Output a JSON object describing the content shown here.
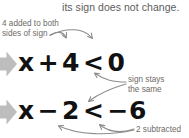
{
  "figure": {
    "header_text": "its sign does not change.",
    "colors": {
      "background": "#ffffff",
      "header_text": "#5d5d5d",
      "annotation_text": "#6e6a66",
      "equation_text": "#111111",
      "bullet_gray": "#bdbdbd",
      "arrow_gray": "#8c8c8c"
    }
  },
  "annotations": {
    "added_to_both_sides": "4 added to both\nsides of sign",
    "sign_stays_the_same": "sign stays\nthe same",
    "two_subtracted": "2 subtracted"
  },
  "equations": [
    {
      "id": "equation-1",
      "full": "x + 4 < 0",
      "left_variable": "x",
      "operator": "+",
      "operand": "4",
      "relation": "<",
      "right_side": "0"
    },
    {
      "id": "equation-2",
      "full": "x − 2 < −6",
      "left_variable": "x",
      "operator": "−",
      "operand": "2",
      "relation": "<",
      "right_side": "−6"
    }
  ],
  "bullets": [
    {
      "id": "bullet-1",
      "icon": "right-arrow-bullet-icon"
    },
    {
      "id": "bullet-2",
      "icon": "right-arrow-bullet-icon"
    }
  ]
}
